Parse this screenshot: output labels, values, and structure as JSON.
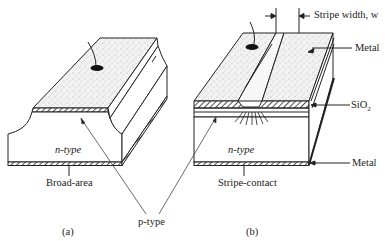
{
  "figure": {
    "panel_a": {
      "caption": "(a)",
      "type_label": "Broad-area",
      "region_label": "n-type"
    },
    "panel_b": {
      "caption": "(b)",
      "type_label": "Stripe-contact",
      "region_label": "n-type",
      "stripe_label": "Stripe width, w",
      "top_metal_label": "Metal",
      "oxide_label": "SiO2",
      "oxide_label_base": "SiO",
      "oxide_label_sub": "2",
      "bottom_metal_label": "Metal"
    },
    "shared_label": "p-type"
  },
  "colors": {
    "ink": "#222222",
    "stipple": "#9a9a9a",
    "background": "#ffffff"
  }
}
